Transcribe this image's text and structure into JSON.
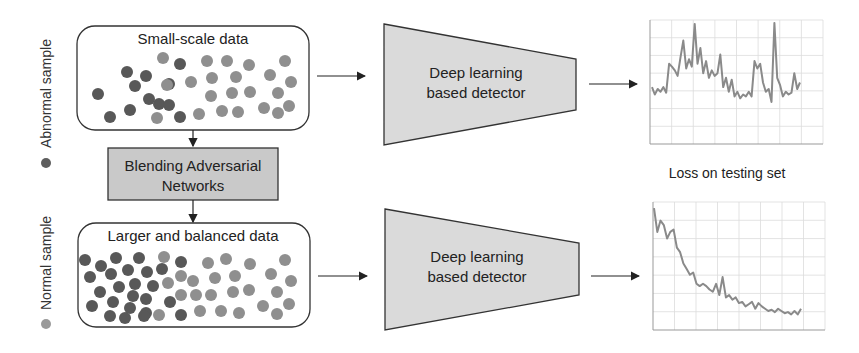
{
  "legend": {
    "abnormal": {
      "label": "Abnormal sample",
      "color": "#5a5a5a"
    },
    "normal": {
      "label": "Normal sample",
      "color": "#8c8c8c"
    }
  },
  "top_row": {
    "data_box": {
      "title": "Small-scale data"
    },
    "detector": {
      "line1": "Deep learning",
      "line2": "based detector"
    }
  },
  "middle": {
    "gan_box": {
      "line1": "Blending Adversarial",
      "line2": "Networks"
    },
    "chart_caption": "Loss on testing set"
  },
  "bottom_row": {
    "data_box": {
      "title": "Larger and balanced data"
    },
    "detector": {
      "line1": "Deep learning",
      "line2": "based detector"
    }
  },
  "colors": {
    "abnormal_dot": "#555555",
    "normal_dot": "#8f8f8f",
    "box_border": "#333333",
    "detector_fill": "#d9d9d9",
    "gan_fill": "#c8c8c8",
    "curve": "#8a8a8a",
    "grid": "#dddddd"
  },
  "chart_data": [
    {
      "type": "line",
      "title": "",
      "caption": "Loss on testing set (without augmentation)",
      "xlabel": "",
      "ylabel": "",
      "grid": true,
      "y": [
        0.3,
        0.22,
        0.28,
        0.25,
        0.3,
        0.24,
        0.55,
        0.52,
        0.48,
        0.42,
        0.62,
        0.8,
        0.5,
        0.6,
        0.52,
        0.98,
        0.55,
        0.72,
        0.45,
        0.58,
        0.4,
        0.48,
        0.42,
        0.45,
        0.65,
        0.3,
        0.4,
        0.25,
        0.38,
        0.2,
        0.25,
        0.18,
        0.22,
        0.2,
        0.25,
        0.2,
        0.58,
        0.5,
        0.55,
        0.35,
        0.25,
        0.28,
        0.14,
        0.99,
        0.4,
        0.32,
        0.2,
        0.25,
        0.22,
        0.24,
        0.45,
        0.28,
        0.35
      ]
    },
    {
      "type": "line",
      "title": "",
      "caption": "Loss on testing set (with augmentation)",
      "xlabel": "",
      "ylabel": "",
      "grid": true,
      "y": [
        0.99,
        0.78,
        0.88,
        0.84,
        0.72,
        0.78,
        0.8,
        0.64,
        0.6,
        0.5,
        0.45,
        0.4,
        0.42,
        0.32,
        0.3,
        0.32,
        0.3,
        0.27,
        0.25,
        0.32,
        0.22,
        0.38,
        0.2,
        0.22,
        0.18,
        0.2,
        0.15,
        0.16,
        0.12,
        0.14,
        0.16,
        0.1,
        0.15,
        0.12,
        0.1,
        0.08,
        0.09,
        0.07,
        0.1,
        0.08,
        0.06,
        0.07,
        0.05,
        0.08,
        0.05,
        0.1
      ]
    }
  ]
}
